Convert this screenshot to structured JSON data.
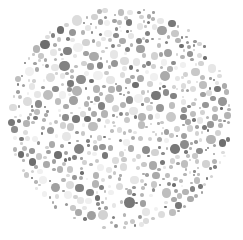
{
  "image": {
    "kind": "ishihara-color-vision-test-plate",
    "rendering": "grayscale",
    "width": 243,
    "height": 240,
    "background_color": "#ffffff",
    "hidden_figure_visible": false,
    "hidden_figure_text": ""
  },
  "plate": {
    "shape": "circle",
    "center_x": 120,
    "center_y": 118,
    "radius": 113,
    "disc_background_color": "#ffffff"
  },
  "dots": {
    "count_approx": 620,
    "min_diameter": 2,
    "max_diameter": 13,
    "palette": [
      "#6e6e6e",
      "#787878",
      "#828282",
      "#8c8c8c",
      "#969696",
      "#a0a0a0",
      "#aaaaaa",
      "#b4b4b4",
      "#bebebe",
      "#c8c8c8",
      "#d2d2d2",
      "#dcdcdc",
      "#e6e6e6",
      "#f0f0f0"
    ],
    "palette_weights": [
      4,
      5,
      6,
      7,
      8,
      9,
      9,
      9,
      9,
      9,
      9,
      9,
      8,
      7
    ],
    "size_buckets": [
      {
        "diameter": 2.5,
        "weight": 14
      },
      {
        "diameter": 3.5,
        "weight": 16
      },
      {
        "diameter": 4.5,
        "weight": 14
      },
      {
        "diameter": 5.5,
        "weight": 13
      },
      {
        "diameter": 6.5,
        "weight": 12
      },
      {
        "diameter": 7.5,
        "weight": 10
      },
      {
        "diameter": 8.5,
        "weight": 8
      },
      {
        "diameter": 9.5,
        "weight": 6
      },
      {
        "diameter": 10.5,
        "weight": 4
      },
      {
        "diameter": 12.0,
        "weight": 3
      }
    ],
    "seed": 20240517
  }
}
